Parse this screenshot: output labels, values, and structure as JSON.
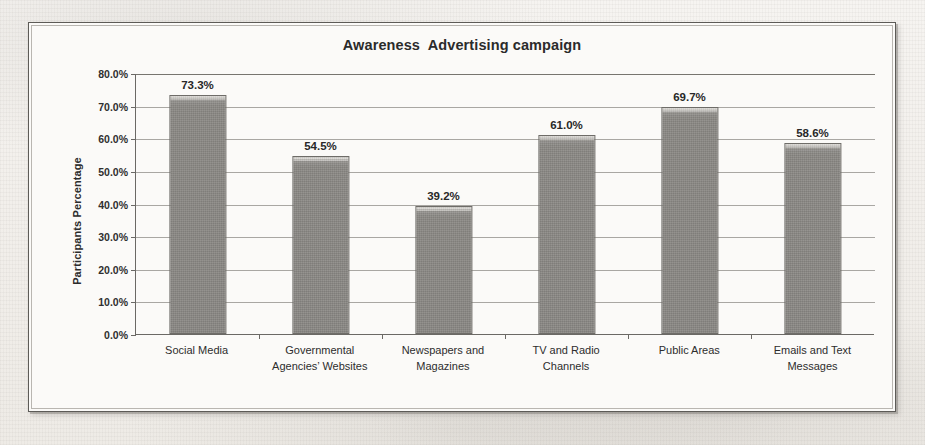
{
  "chart_data": {
    "type": "bar",
    "title": "Awareness  Advertising campaign",
    "xlabel": "",
    "ylabel": "Participants Percentage",
    "categories": [
      "Social Media",
      "Governmental Agencies’ Websites",
      "Newspapers and Magazines",
      "TV and Radio Channels",
      "Public Areas",
      "Emails and Text Messages"
    ],
    "values": [
      73.3,
      54.5,
      39.2,
      61.0,
      69.7,
      58.6
    ],
    "data_labels": [
      "73.3%",
      "54.5%",
      "39.2%",
      "61.0%",
      "69.7%",
      "58.6%"
    ],
    "ylim": [
      0,
      80
    ],
    "ytick_values": [
      0,
      10,
      20,
      30,
      40,
      50,
      60,
      70,
      80
    ],
    "ytick_labels": [
      "0.0%",
      "10.0%",
      "20.0%",
      "30.0%",
      "40.0%",
      "50.0%",
      "60.0%",
      "70.0%",
      "80.0%"
    ],
    "grid": true,
    "legend": false,
    "bar_color": "#8a8884",
    "bar_edge_color": "#6e6c68",
    "axis_color": "#6b6965",
    "gridline_color": "#a9a7a3",
    "text_color": "#2b2b2b",
    "plot_background": "#fbfaf8"
  }
}
